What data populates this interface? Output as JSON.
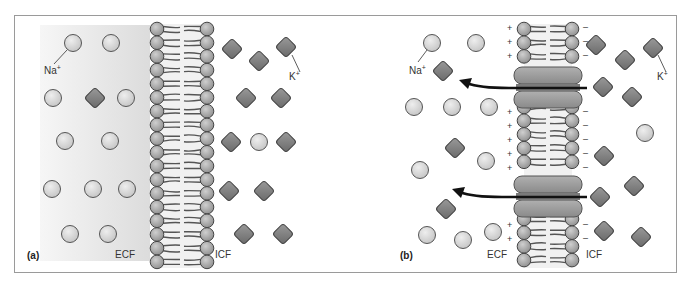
{
  "figure": {
    "panel_a": {
      "label": "(a)",
      "ecf_label": "ECF",
      "icf_label": "ICF",
      "na_label": "Na",
      "k_label": "K",
      "ion_charge": "+"
    },
    "panel_b": {
      "label": "(b)",
      "ecf_label": "ECF",
      "icf_label": "ICF",
      "na_label": "Na",
      "k_label": "K",
      "ion_charge": "+",
      "outer_charge": "+",
      "inner_charge": "–"
    }
  },
  "colors": {
    "sodium_fill": "#d9d9d9",
    "potassium_fill": "#8a8a8a",
    "lipid_head": "#a8a8a8",
    "channel": "#9c9c9c",
    "arrow": "#111111"
  }
}
